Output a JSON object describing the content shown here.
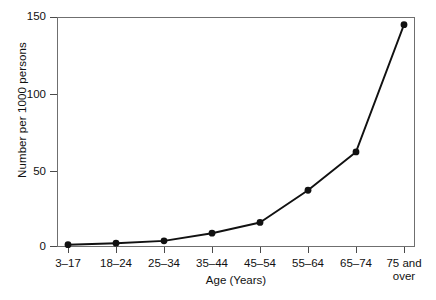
{
  "chart_data": {
    "type": "line",
    "title": "",
    "xlabel": "Age (Years)",
    "ylabel": "Number per 1000 persons",
    "categories": [
      "3–17",
      "18–24",
      "25–34",
      "35–44",
      "45–54",
      "55–64",
      "65–74",
      "75 and over"
    ],
    "category_lines": [
      [
        "3–17"
      ],
      [
        "18–24"
      ],
      [
        "25–34"
      ],
      [
        "35–44"
      ],
      [
        "45–54"
      ],
      [
        "55–64"
      ],
      [
        "65–74"
      ],
      [
        "75 and",
        "over"
      ]
    ],
    "values": [
      1.5,
      2.5,
      4,
      9,
      16,
      37,
      62,
      145
    ],
    "ylim": [
      0,
      150
    ],
    "yticks": [
      0,
      50,
      100,
      150
    ],
    "ytick_labels": [
      "0",
      "50",
      "100",
      "150"
    ],
    "grid": false,
    "legend": false,
    "series_color": "#111111",
    "marker": "circle",
    "marker_color": "#111111",
    "frame_color": "#6f6f6f",
    "background_color": "#ffffff"
  }
}
